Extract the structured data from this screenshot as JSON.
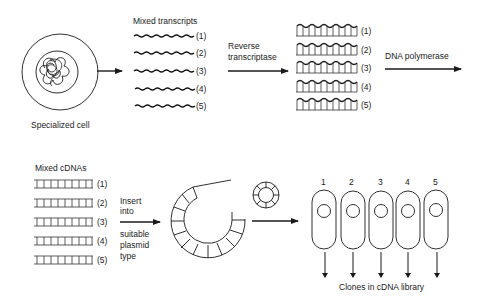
{
  "diagram": {
    "cell_label": "Specialized cell",
    "transcripts_title": "Mixed transcripts",
    "rt_label_line1": "Reverse",
    "rt_label_line2": "transcriptase",
    "polymerase_label": "DNA polymerase",
    "cdnas_title": "Mixed cDNAs",
    "insert_line1": "Insert",
    "insert_line2": "into",
    "insert_line3": "suitable",
    "insert_line4": "plasmid",
    "insert_line5": "type",
    "clones_label": "Clones in cDNA library",
    "row_labels": [
      "(1)",
      "(2)",
      "(3)",
      "(4)",
      "(5)"
    ],
    "clone_numbers": [
      "1",
      "2",
      "3",
      "4",
      "5"
    ],
    "line_color": "#1a1a1a"
  }
}
